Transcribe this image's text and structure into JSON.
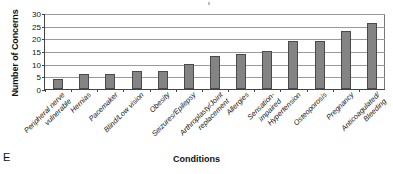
{
  "panel_letter": "E",
  "chart_data": {
    "type": "bar",
    "title": "",
    "xlabel": "Conditions",
    "ylabel": "Number of Concerns",
    "ylim": [
      0,
      30
    ],
    "yticks": [
      0,
      5,
      10,
      15,
      20,
      25,
      30
    ],
    "grid": true,
    "legend": "none",
    "bar_color": "#848484",
    "bar_edge_color": "#4a4a4a",
    "axis_color": "#444444",
    "categories": [
      "Peripheral nerve vulnerable",
      "Hernias",
      "Pacemaker",
      "Blind/Low vision",
      "Obesity",
      "Seizures/Epilepsy",
      "Arthroplasty/Joint replacement",
      "Allergies",
      "Sensation-impaired",
      "Hypertension",
      "Osteoporosis",
      "Pregnancy",
      "Anticoagulated/Bleeding"
    ],
    "category_lines": [
      [
        "Peripheral nerve",
        "vulnerable"
      ],
      [
        "Hernias"
      ],
      [
        "Pacemaker"
      ],
      [
        "Blind/Low vision"
      ],
      [
        "Obesity"
      ],
      [
        "Seizures/Epilepsy"
      ],
      [
        "Arthroplasty/Joint",
        "replacement"
      ],
      [
        "Allergies"
      ],
      [
        "Sensation-",
        "impaired"
      ],
      [
        "Hypertension"
      ],
      [
        "Osteoporosis"
      ],
      [
        "Pregnancy"
      ],
      [
        "Anticoagulated/",
        "Bleeding"
      ]
    ],
    "values": [
      4,
      6,
      6,
      7,
      7,
      10,
      13,
      14,
      15,
      19,
      19,
      23,
      26
    ]
  }
}
